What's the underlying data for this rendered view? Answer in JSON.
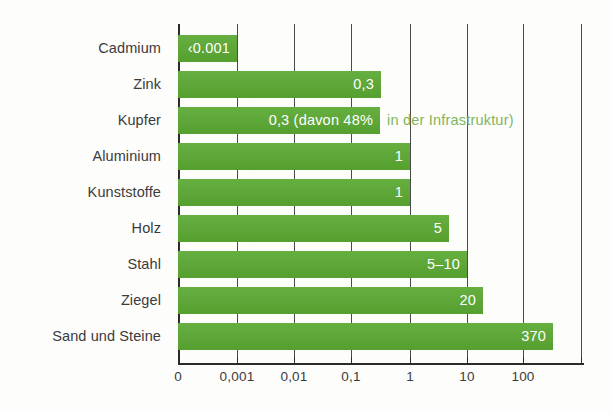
{
  "chart_data": {
    "type": "bar",
    "orientation": "horizontal",
    "title": "",
    "subtitle": "",
    "xlabel": "",
    "ylabel": "",
    "xscale": "log",
    "grid": true,
    "legend": "none",
    "axis_tick_labels": [
      "0",
      "0,001",
      "0,01",
      "0,1",
      "1",
      "10",
      "100"
    ],
    "axis_tick_values": [
      0,
      0.001,
      0.01,
      0.1,
      1,
      10,
      100
    ],
    "categories": [
      "Cadmium",
      "Zink",
      "Kupfer",
      "Aluminium",
      "Kunststoffe",
      "Holz",
      "Stahl",
      "Ziegel",
      "Sand und Steine"
    ],
    "values": [
      0.001,
      0.3,
      0.3,
      1,
      1,
      5,
      7.5,
      20,
      370
    ],
    "value_labels": [
      "‹0.001",
      "0,3",
      "0,3 (davon 48%",
      "1",
      "1",
      "5",
      "5–10",
      "20",
      "370"
    ],
    "annotations": [
      {
        "category": "Kupfer",
        "text": "in der Infrastruktur)",
        "color": "#7fb560",
        "placement": "outside-right"
      }
    ],
    "colors": {
      "bar": "#5aa832",
      "bar_label": "#ffffff",
      "annotation": "#7fb560",
      "axis": "#2b2b2b",
      "gridline": "#4a4a4a",
      "category_label": "#3b3b3b",
      "background": "#fdfdfc"
    }
  },
  "bars": [
    {
      "label": "Cadmium",
      "value_label": "‹0.001",
      "width_px": 59,
      "note": ""
    },
    {
      "label": "Zink",
      "value_label": "0,3",
      "width_px": 203,
      "note": ""
    },
    {
      "label": "Kupfer",
      "value_label": "0,3 (davon 48%",
      "width_px": 202,
      "note": "in der Infrastruktur)"
    },
    {
      "label": "Aluminium",
      "value_label": "1",
      "width_px": 232,
      "note": ""
    },
    {
      "label": "Kunststoffe",
      "value_label": "1",
      "width_px": 232,
      "note": ""
    },
    {
      "label": "Holz",
      "value_label": "5",
      "width_px": 271,
      "note": ""
    },
    {
      "label": "Stahl",
      "value_label": "5–10",
      "width_px": 289,
      "note": ""
    },
    {
      "label": "Ziegel",
      "value_label": "20",
      "width_px": 305,
      "note": ""
    },
    {
      "label": "Sand und Steine",
      "value_label": "370",
      "width_px": 375,
      "note": ""
    }
  ],
  "axis": {
    "ticks": [
      {
        "label": "0",
        "x_px": 0
      },
      {
        "label": "0,001",
        "x_px": 59
      },
      {
        "label": "0,01",
        "x_px": 116
      },
      {
        "label": "0,1",
        "x_px": 173
      },
      {
        "label": "1",
        "x_px": 232
      },
      {
        "label": "10",
        "x_px": 289
      },
      {
        "label": "100",
        "x_px": 345
      }
    ],
    "extra_gridline_x_px": [
      403
    ]
  }
}
